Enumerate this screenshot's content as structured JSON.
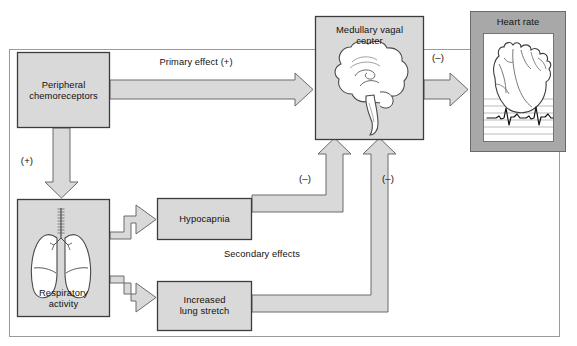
{
  "figure": {
    "type": "physiology-flow-diagram",
    "colors": {
      "box_fill": "#d9d9d9",
      "box_stroke": "#3c3c3c",
      "arrow_fill": "#d9d9d9",
      "arrow_stroke": "#5a5a5a",
      "heart_panel_fill": "#a8a8a8",
      "inner_panel_fill": "#ffffff",
      "frame_stroke": "#8c8c8c",
      "text": "#111111",
      "ecg_line": "#111111",
      "organ_stroke": "#4a4a4a"
    }
  },
  "nodes": [
    {
      "id": "peripheral-chemoreceptors",
      "label": "Peripheral\nchemoreceptors",
      "x": 17,
      "y": 52,
      "w": 93,
      "h": 76,
      "style": "plain-box"
    },
    {
      "id": "respiratory-activity",
      "label": "Respiratory\nactivity",
      "x": 17,
      "y": 199,
      "w": 93,
      "h": 118,
      "style": "organ-box",
      "organ": "lungs-illustration"
    },
    {
      "id": "hypocapnia",
      "label": "Hypocapnia",
      "x": 157,
      "y": 198,
      "w": 95,
      "h": 42,
      "style": "plain-box"
    },
    {
      "id": "increased-lung-stretch",
      "label": "Increased\nlung stretch",
      "x": 157,
      "y": 281,
      "w": 95,
      "h": 50,
      "style": "plain-box"
    },
    {
      "id": "medullary-vagal-center",
      "label": "Medullary vagal\ncenter",
      "x": 315,
      "y": 16,
      "w": 109,
      "h": 124,
      "style": "organ-box",
      "organ": "brain-illustration"
    },
    {
      "id": "heart-rate",
      "label": "Heart rate",
      "x": 470,
      "y": 11,
      "w": 96,
      "h": 141,
      "style": "shaded-panel",
      "organ": "heart-illustration-with-ecg"
    }
  ],
  "edges": [
    {
      "id": "chemoreceptors-to-medulla",
      "from": "peripheral-chemoreceptors",
      "to": "medullary-vagal-center",
      "label": "Primary effect (+)",
      "label_x": 196,
      "label_y": 58,
      "direction": "right"
    },
    {
      "id": "chemoreceptors-to-respiratory",
      "from": "peripheral-chemoreceptors",
      "to": "respiratory-activity",
      "label": "(+)",
      "label_x": 25,
      "label_y": 156,
      "direction": "down"
    },
    {
      "id": "respiratory-to-hypocapnia",
      "from": "respiratory-activity",
      "to": "hypocapnia",
      "label": "",
      "direction": "up-right"
    },
    {
      "id": "respiratory-to-lung-stretch",
      "from": "respiratory-activity",
      "to": "increased-lung-stretch",
      "label": "",
      "direction": "down-right"
    },
    {
      "id": "hypocapnia-to-medulla",
      "from": "hypocapnia",
      "to": "medullary-vagal-center",
      "label": "(–)",
      "label_x": 304,
      "label_y": 176,
      "direction": "up"
    },
    {
      "id": "lung-stretch-to-medulla",
      "from": "increased-lung-stretch",
      "to": "medullary-vagal-center",
      "label": "(–)",
      "label_x": 387,
      "label_y": 176,
      "direction": "up"
    },
    {
      "id": "medulla-to-heart-rate",
      "from": "medullary-vagal-center",
      "to": "heart-rate",
      "label": "(–)",
      "label_x": 437,
      "label_y": 54,
      "direction": "right"
    }
  ],
  "annotations": [
    {
      "id": "secondary-effects",
      "text": "Secondary effects",
      "x": 262,
      "y": 251
    }
  ]
}
